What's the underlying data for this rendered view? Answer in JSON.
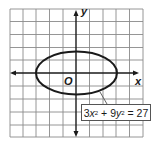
{
  "figure": {
    "type": "coordinate-plane-graph",
    "grid": {
      "columns": 10,
      "rows": 10,
      "cell_px": 13.3,
      "line_color": "#8a8a8a",
      "border_color": "#8a8a8a"
    },
    "axes": {
      "x_label": "x",
      "y_label": "y",
      "origin_label": "O",
      "color": "#1a1a1a"
    },
    "curve": {
      "shape": "ellipse",
      "equation": {
        "coef_x": "3",
        "var_x": "x",
        "exp_x": "2",
        "plus": "+",
        "coef_y": "9",
        "var_y": "y",
        "exp_y": "2",
        "equals": "=",
        "rhs": "27"
      },
      "equation_text": "3x² + 9y² = 27",
      "semi_major_x": 3,
      "semi_minor_y": 1.73,
      "center": [
        0,
        0
      ],
      "stroke_color": "#1a1a1a"
    }
  }
}
